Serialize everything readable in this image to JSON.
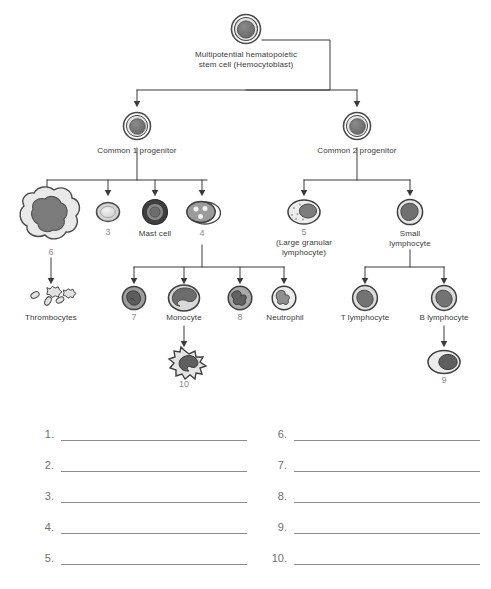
{
  "diagram": {
    "title_node": {
      "label": "Multipotential hematopoietic\nstem cell (Hemocytoblast)",
      "icon": "stem-cell-icon"
    },
    "level2": [
      {
        "id": "common1",
        "label": "Common 1 progenitor",
        "icon": "progenitor-cell-icon"
      },
      {
        "id": "common2",
        "label": "Common 2 progenitor",
        "icon": "progenitor-cell-icon"
      }
    ],
    "level3": [
      {
        "id": "megakaryocyte",
        "label": "",
        "number": "6",
        "icon": "megakaryocyte-icon"
      },
      {
        "id": "erythrocyte",
        "label": "",
        "number": "3",
        "icon": "erythrocyte-icon"
      },
      {
        "id": "mastcell",
        "label": "Mast cell",
        "number": "",
        "icon": "mast-cell-icon"
      },
      {
        "id": "myeloblast",
        "label": "",
        "number": "4",
        "icon": "myeloblast-icon"
      },
      {
        "id": "nkcell",
        "label": "(Large granular\nlymphocyte)",
        "number": "5",
        "icon": "large-granular-lymphocyte-icon"
      },
      {
        "id": "smalllymph",
        "label": "Small\nlymphocyte",
        "number": "",
        "icon": "small-lymphocyte-icon"
      }
    ],
    "level4": [
      {
        "id": "thrombocytes",
        "label": "Thrombocytes",
        "number": "",
        "icon": "thrombocytes-icon"
      },
      {
        "id": "basophil",
        "label": "",
        "number": "7",
        "icon": "basophil-icon"
      },
      {
        "id": "monocyte",
        "label": "Monocyte",
        "number": "",
        "icon": "monocyte-icon"
      },
      {
        "id": "eosinophil",
        "label": "",
        "number": "8",
        "icon": "eosinophil-icon"
      },
      {
        "id": "neutrophil",
        "label": "Neutrophil",
        "number": "",
        "icon": "neutrophil-icon"
      },
      {
        "id": "tlymph",
        "label": "T lymphocyte",
        "number": "",
        "icon": "t-lymphocyte-icon"
      },
      {
        "id": "blymph",
        "label": "B lymphocyte",
        "number": "",
        "icon": "b-lymphocyte-icon"
      }
    ],
    "level5": [
      {
        "id": "macrophage",
        "label": "",
        "number": "10",
        "icon": "macrophage-icon"
      },
      {
        "id": "plasmacell",
        "label": "",
        "number": "9",
        "icon": "plasma-cell-icon"
      }
    ]
  },
  "answers": {
    "left": [
      "1.",
      "2.",
      "3.",
      "4.",
      "5."
    ],
    "right": [
      "6.",
      "7.",
      "8.",
      "9.",
      "10."
    ]
  },
  "colors": {
    "line": "#3a3a3a",
    "cell_dark": "#6e6e6e",
    "cell_mid": "#9a9a9a",
    "cell_light": "#d6d6d6",
    "cell_pale": "#ececec",
    "text": "#3a3a3a",
    "number": "#8d8d8d",
    "blank_line": "#8c8c8c"
  }
}
